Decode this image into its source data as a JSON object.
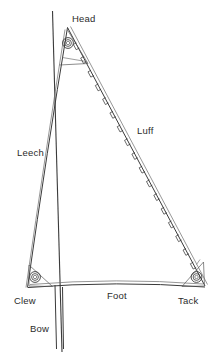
{
  "diagram": {
    "type": "line-drawing",
    "background_color": "#ffffff",
    "line_color": "#3a3a3a",
    "label_color": "#2b2b2b",
    "canvas": {
      "width": 221,
      "height": 353
    },
    "labels": {
      "head": "Head",
      "luff": "Luff",
      "leech": "Leech",
      "foot": "Foot",
      "clew": "Clew",
      "tack": "Tack",
      "bow": "Bow"
    },
    "geometry": {
      "head_point": {
        "x": 67,
        "y": 27
      },
      "clew_point": {
        "x": 27,
        "y": 287
      },
      "tack_point": {
        "x": 205,
        "y": 287
      },
      "mast_top": {
        "x": 52,
        "y": 12
      },
      "mast_bottom": {
        "x": 62,
        "y": 353
      },
      "forestay_top": {
        "x": 55,
        "y": 285
      },
      "forestay_bottom": {
        "x": 57,
        "y": 348
      }
    },
    "grommets": [
      {
        "name": "head-grommet",
        "x": 68,
        "y": 43,
        "r": 5.2
      },
      {
        "name": "clew-grommet",
        "x": 35,
        "y": 277,
        "r": 5.2
      },
      {
        "name": "tack-grommet",
        "x": 198,
        "y": 277,
        "r": 5.2
      }
    ],
    "hank_count": 17,
    "hank_label": "hank"
  }
}
